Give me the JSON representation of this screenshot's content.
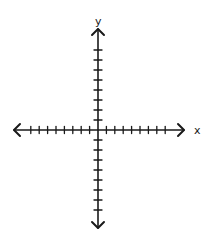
{
  "diagram": {
    "type": "cartesian-axes",
    "origin": {
      "x": 98,
      "y": 130
    },
    "x_axis": {
      "label": "x",
      "left_end": 14,
      "right_end": 184,
      "ticks_negative": 8,
      "ticks_positive": 8,
      "tick_spacing": 8.4,
      "arrows": [
        "left",
        "right"
      ]
    },
    "y_axis": {
      "label": "y",
      "top_end": 29,
      "bottom_end": 228,
      "ticks_positive": 8,
      "ticks_negative": 8,
      "tick_spacing": 10,
      "arrows": [
        "up",
        "down"
      ]
    },
    "stroke_color": "#1a1a1a",
    "background": "#ffffff"
  }
}
